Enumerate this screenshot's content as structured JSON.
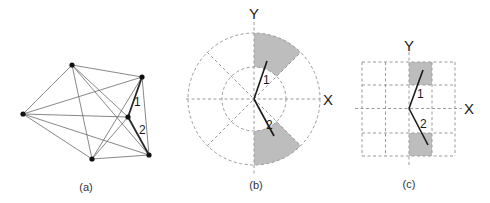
{
  "panels": {
    "a": {
      "caption": "(a)",
      "type": "complete-graph",
      "nodes": [
        {
          "id": "A",
          "x": 72,
          "y": 65
        },
        {
          "id": "B",
          "x": 142,
          "y": 77
        },
        {
          "id": "C",
          "x": 23,
          "y": 114
        },
        {
          "id": "D",
          "x": 128,
          "y": 117
        },
        {
          "id": "E",
          "x": 92,
          "y": 159
        },
        {
          "id": "F",
          "x": 149,
          "y": 155
        }
      ],
      "highlighted_edges": [
        {
          "from": "B",
          "to": "D",
          "label": "1"
        },
        {
          "from": "D",
          "to": "F",
          "label": "2"
        }
      ]
    },
    "b": {
      "caption": "(b)",
      "type": "polar-grid",
      "x_label": "X",
      "y_label": "Y",
      "segment_labels": [
        "1",
        "2"
      ],
      "shaded_sectors": [
        "45°–90° outer ring",
        "-90°–-45° outer ring"
      ]
    },
    "c": {
      "caption": "(c)",
      "type": "square-grid",
      "x_label": "X",
      "y_label": "Y",
      "segment_labels": [
        "1",
        "2"
      ],
      "grid_size": "4x4",
      "shaded_cells": [
        "row 1, col 3",
        "row 4, col 3"
      ]
    }
  },
  "colors": {
    "shade": "#bdbdbd",
    "grid": "#9a9a9a",
    "edge": "#6a6a6a",
    "highlight": "#2a2a2a"
  }
}
